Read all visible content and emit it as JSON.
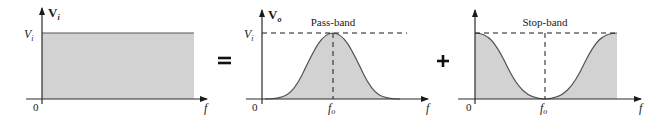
{
  "figure": {
    "operators": {
      "equals": "=",
      "plus": "+"
    },
    "panels": [
      {
        "id": "input",
        "y_axis_label": "V",
        "y_axis_label_sub": "i",
        "level_label": "V",
        "level_label_sub": "i",
        "origin_label": "0",
        "x_axis_label": "f",
        "shape": "flat spectrum (constant amplitude Vi for all f)"
      },
      {
        "id": "pass-band",
        "title": "Pass-band",
        "y_axis_label": "V",
        "y_axis_label_sub": "o",
        "level_label": "V",
        "level_label_sub": "i",
        "origin_label": "0",
        "center_label": "f",
        "center_label_sub": "o",
        "x_axis_label": "f",
        "shape": "bell curve peaking at Vi at fo"
      },
      {
        "id": "stop-band",
        "title": "Stop-band",
        "origin_label": "0",
        "center_label": "f",
        "center_label_sub": "o",
        "x_axis_label": "f",
        "shape": "inverted bell, zero at fo, Vi at edges"
      }
    ],
    "colors": {
      "fill": "#d2d2d2",
      "axis": "#2b2b2b",
      "curve": "#555555",
      "text": "#1a1a1a"
    }
  }
}
